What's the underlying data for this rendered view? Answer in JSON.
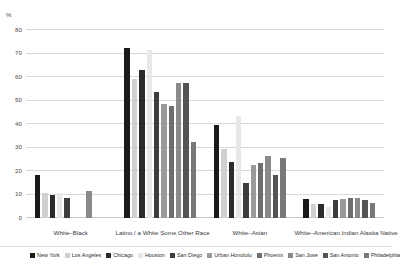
{
  "chart_data": {
    "type": "bar",
    "title": "",
    "subtitle": "",
    "xlabel": "",
    "ylabel": "",
    "unit_label": "%",
    "ylim": [
      0,
      80
    ],
    "yticks": [
      0,
      10,
      20,
      30,
      40,
      50,
      60,
      70,
      80
    ],
    "grid": true,
    "legend_position": "bottom",
    "categories": [
      "White–Black",
      "Latino / a White Some Other Race",
      "White–Asian",
      "White–American Indian Alaska Native"
    ],
    "series": [
      {
        "name": "New York",
        "color": "#1a1a1a",
        "values": [
          18.5,
          72.5,
          39.5,
          8.0
        ]
      },
      {
        "name": "Los Angeles",
        "color": "#d0d0d0",
        "values": [
          10.5,
          59.0,
          29.5,
          6.0
        ]
      },
      {
        "name": "Chicago",
        "color": "#2b2b2b",
        "values": [
          10.0,
          63.0,
          24.0,
          6.0
        ]
      },
      {
        "name": "Houston",
        "color": "#e8e8e8",
        "values": [
          10.5,
          71.5,
          43.5,
          4.5
        ]
      },
      {
        "name": "San Diego",
        "color": "#3d3d3d",
        "values": [
          8.5,
          53.5,
          15.0,
          7.5
        ]
      },
      {
        "name": "Urban Honolulu",
        "color": "#9a9a9a",
        "values": [
          0.0,
          48.5,
          22.5,
          8.0
        ]
      },
      {
        "name": "Phoenix",
        "color": "#6e6e6e",
        "values": [
          0.0,
          47.5,
          23.5,
          8.5
        ]
      },
      {
        "name": "San Jose",
        "color": "#8a8a8a",
        "values": [
          11.5,
          57.5,
          26.5,
          8.5
        ]
      },
      {
        "name": "San Antonio",
        "color": "#545454",
        "values": [
          0.0,
          57.5,
          18.5,
          7.5
        ]
      },
      {
        "name": "Philadelphia",
        "color": "#787878",
        "values": [
          0.0,
          32.5,
          25.5,
          6.5
        ]
      }
    ]
  }
}
